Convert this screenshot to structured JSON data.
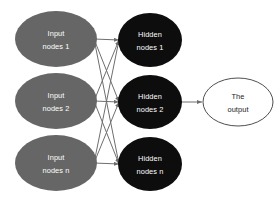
{
  "diagram": {
    "background_color": "#ffffff",
    "colors": {
      "input_node_fill": "#666666",
      "hidden_node_fill": "#0d0d0d",
      "output_node_fill": "#ffffff",
      "output_node_stroke": "#3b3b3b",
      "edge_color": "#6e6e6e",
      "input_label_color": "#ffffff",
      "hidden_label_color": "#ffffff",
      "output_label_color": "#1a1a1a"
    },
    "layers": {
      "input": {
        "name": "input-layer",
        "nodes": [
          {
            "line1": "Input",
            "line2": "nodes 1",
            "cx": 56,
            "cy": 39,
            "rx": 41,
            "ry": 28
          },
          {
            "line1": "Input",
            "line2": "nodes 2",
            "cx": 56,
            "cy": 101,
            "rx": 41,
            "ry": 28
          },
          {
            "line1": "Input",
            "line2": "nodes n",
            "cx": 56,
            "cy": 163,
            "rx": 41,
            "ry": 28
          }
        ]
      },
      "hidden": {
        "name": "hidden-layer",
        "nodes": [
          {
            "line1": "Hidden",
            "line2": "nodes 1",
            "cx": 150,
            "cy": 40,
            "rx": 32,
            "ry": 27
          },
          {
            "line1": "Hidden",
            "line2": "nodes 2",
            "cx": 150,
            "cy": 102,
            "rx": 32,
            "ry": 27
          },
          {
            "line1": "Hidden",
            "line2": "nodes n",
            "cx": 150,
            "cy": 164,
            "rx": 32,
            "ry": 27
          }
        ]
      },
      "output": {
        "name": "output-layer",
        "nodes": [
          {
            "line1": "The",
            "line2": "output",
            "cx": 238,
            "cy": 102,
            "rx": 35,
            "ry": 24
          }
        ]
      }
    },
    "connections": {
      "input_to_hidden": [
        {
          "from": 0,
          "to": 0
        },
        {
          "from": 0,
          "to": 1
        },
        {
          "from": 0,
          "to": 2
        },
        {
          "from": 1,
          "to": 0
        },
        {
          "from": 1,
          "to": 1
        },
        {
          "from": 1,
          "to": 2
        },
        {
          "from": 2,
          "to": 0
        },
        {
          "from": 2,
          "to": 1
        },
        {
          "from": 2,
          "to": 2
        }
      ],
      "hidden_to_output": [
        {
          "from": 1,
          "to": 0
        }
      ]
    }
  }
}
